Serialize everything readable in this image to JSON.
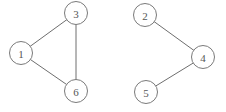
{
  "figure": {
    "width": 226,
    "height": 112,
    "background_color": "#ffffff",
    "title": ""
  },
  "chart_data": {
    "type": "diagram",
    "diagram_kind": "undirected-graph",
    "title": "",
    "node_radius": 11.5,
    "node_fill": "#ffffff",
    "node_stroke": "#7a7a7a",
    "edge_stroke": "#6e6e6e",
    "label_color": "#565656",
    "nodes": [
      {
        "id": "1",
        "label": "1",
        "x": 21,
        "y": 53
      },
      {
        "id": "3",
        "label": "3",
        "x": 76,
        "y": 13
      },
      {
        "id": "6",
        "label": "6",
        "x": 76,
        "y": 91
      },
      {
        "id": "2",
        "label": "2",
        "x": 145,
        "y": 15
      },
      {
        "id": "4",
        "label": "4",
        "x": 203,
        "y": 57
      },
      {
        "id": "5",
        "label": "5",
        "x": 146,
        "y": 92
      }
    ],
    "edges": [
      {
        "source": "1",
        "target": "3"
      },
      {
        "source": "1",
        "target": "6"
      },
      {
        "source": "3",
        "target": "6"
      },
      {
        "source": "2",
        "target": "4"
      },
      {
        "source": "5",
        "target": "4"
      }
    ],
    "components": [
      {
        "name": "component-a",
        "nodes": [
          "1",
          "3",
          "6"
        ]
      },
      {
        "name": "component-b",
        "nodes": [
          "2",
          "4",
          "5"
        ]
      }
    ]
  }
}
